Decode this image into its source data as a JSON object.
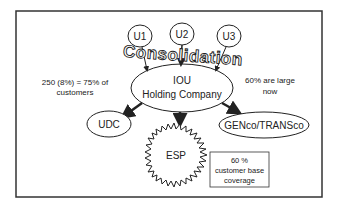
{
  "diagram": {
    "nodes": {
      "u1": "U1",
      "u2": "U2",
      "u3": "U3",
      "hub_line1": "IOU",
      "hub_line2": "Holding Company",
      "udc": "UDC",
      "esp": "ESP",
      "genco": "GENco/TRANSco"
    },
    "banner": "Consolidation",
    "notes": {
      "left_line1": "250 (8%) = 75% of",
      "left_line2": "customers",
      "right_line1": "60% are large",
      "right_line2": "now",
      "box_line1": "60 %",
      "box_line2": "customer base",
      "box_line3": "coverage"
    },
    "colors": {
      "stroke": "#222222",
      "background": "#ffffff"
    }
  }
}
